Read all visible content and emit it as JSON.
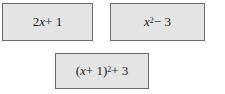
{
  "expressions": [
    {
      "id": "box-1",
      "latex": "2x + 1",
      "parts": {
        "pre": "2",
        "var": "x",
        "post": " + 1"
      }
    },
    {
      "id": "box-2",
      "latex": "x^2 - 3",
      "parts": {
        "var": "x",
        "exp": "2",
        "post": " − 3"
      }
    },
    {
      "id": "box-3",
      "latex": "(x + 1)^2 + 3",
      "parts": {
        "pre": "(",
        "var": "x",
        "mid": " + 1)",
        "exp": "2",
        "post": " + 3"
      }
    }
  ],
  "colors": {
    "box_fill": "#e4e4e4",
    "box_border": "#6a6a6a",
    "text": "#1a1a1a"
  }
}
